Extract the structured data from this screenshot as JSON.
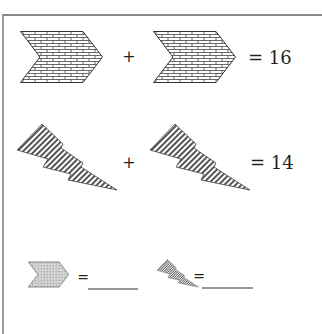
{
  "puzzle": {
    "rows": [
      {
        "shapes": [
          "brick-chevron",
          "brick-chevron"
        ],
        "operator": "+",
        "result": "= 16"
      },
      {
        "shapes": [
          "striped-lightning",
          "striped-lightning"
        ],
        "operator": "+",
        "result": "= 14"
      }
    ],
    "answers": [
      {
        "shape": "brick-chevron",
        "equals": "=",
        "blank": ""
      },
      {
        "shape": "striped-lightning",
        "equals": "=",
        "blank": ""
      }
    ]
  },
  "colors": {
    "outline": "#333333",
    "fill": "#ffffff",
    "stripe": "#555555",
    "border": "#8a8a8a"
  }
}
